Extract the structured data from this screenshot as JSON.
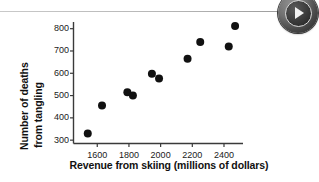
{
  "page": {
    "background_color": "#ffffff",
    "divider_color": "#b4b4b4"
  },
  "media_control": {
    "play_button_name": "Play",
    "icon": "play-triangle-icon",
    "color": "#3a3a3a"
  },
  "chart_data": {
    "type": "scatter",
    "title": "",
    "subtitle": "",
    "xlabel": "Revenue from skiing (millions of dollars)",
    "ylabel_line1": "Number of deaths",
    "ylabel_line2": "from tangling",
    "ylabel": "Number of deaths from tangling",
    "xlim": [
      1450,
      2520
    ],
    "ylim": [
      285,
      830
    ],
    "xticks": [
      1600,
      1800,
      2000,
      2200,
      2400
    ],
    "xtick_labels": [
      "1600",
      "1800",
      "2000",
      "2200",
      "2400"
    ],
    "yticks": [
      300,
      400,
      500,
      600,
      700,
      800
    ],
    "ytick_labels": [
      "300",
      "400",
      "500",
      "600",
      "700",
      "800"
    ],
    "grid": false,
    "legend": null,
    "marker": "filled-circle",
    "marker_color": "#111111",
    "marker_size": 4,
    "points": [
      {
        "x": 1540,
        "y": 330
      },
      {
        "x": 1630,
        "y": 455
      },
      {
        "x": 1790,
        "y": 515
      },
      {
        "x": 1825,
        "y": 500
      },
      {
        "x": 1945,
        "y": 598
      },
      {
        "x": 1990,
        "y": 577
      },
      {
        "x": 2170,
        "y": 665
      },
      {
        "x": 2250,
        "y": 740
      },
      {
        "x": 2430,
        "y": 720
      },
      {
        "x": 2470,
        "y": 812
      }
    ]
  }
}
